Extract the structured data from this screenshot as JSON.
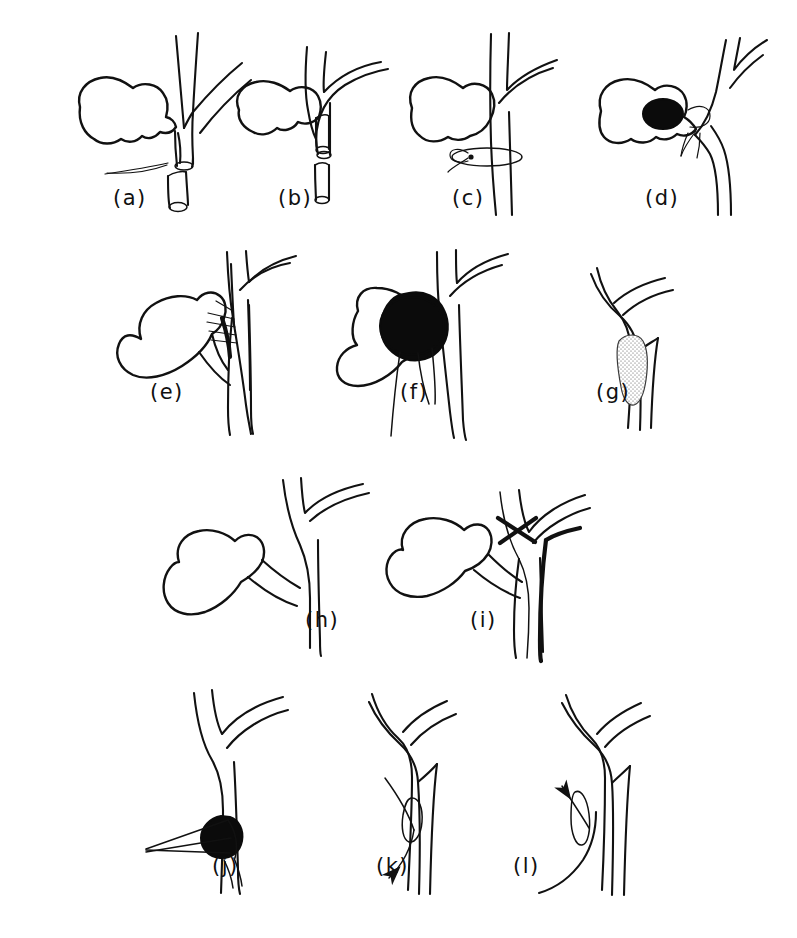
{
  "figure": {
    "kind": "line-drawing-figure",
    "background_color": "#ffffff",
    "ink_color": "#111111",
    "fill_color": "#0b0b0b",
    "stipple_color": "#5a5a5a",
    "width": 797,
    "height": 938,
    "rows": [
      {
        "row_index": 1,
        "panel_labels": [
          "(a)",
          "(b)",
          "(c)",
          "(d)"
        ]
      },
      {
        "row_index": 2,
        "panel_labels": [
          "(e)",
          "(f)",
          "(g)"
        ]
      },
      {
        "row_index": 3,
        "panel_labels": [
          "(h)",
          "(i)"
        ]
      },
      {
        "row_index": 4,
        "panel_labels": [
          "(j)",
          "(k)",
          "(l)"
        ]
      }
    ]
  },
  "panels": [
    {
      "id": "a",
      "label": "(a)",
      "label_x": 113,
      "label_y": 205,
      "features": [
        "gallbladder",
        "bile-duct-tree",
        "transected-duct-stump",
        "detached-duct-segment",
        "fine-suture-thread"
      ]
    },
    {
      "id": "b",
      "label": "(b)",
      "label_x": 278,
      "label_y": 205,
      "features": [
        "gallbladder",
        "curved-bile-duct",
        "cut-duct-end",
        "duct-stump-segment",
        "free-duct-segment"
      ]
    },
    {
      "id": "c",
      "label": "(c)",
      "label_x": 452,
      "label_y": 205,
      "features": [
        "gallbladder",
        "bile-duct-tree",
        "encircling-ligature-loop",
        "suture-knot"
      ]
    },
    {
      "id": "d",
      "label": "(d)",
      "label_x": 645,
      "label_y": 205,
      "features": [
        "gallbladder",
        "black-stone",
        "bile-duct-tree",
        "suture-loop",
        "suture-tails"
      ]
    },
    {
      "id": "e",
      "label": "(e)",
      "label_x": 150,
      "label_y": 399,
      "features": [
        "gallbladder",
        "bile-duct-tree",
        "suture-row",
        "anastomosis"
      ]
    },
    {
      "id": "f",
      "label": "(f)",
      "label_x": 400,
      "label_y": 399,
      "features": [
        "gallbladder",
        "large-black-mass",
        "bile-duct-tree",
        "trailing-threads"
      ]
    },
    {
      "id": "g",
      "label": "(g)",
      "label_x": 596,
      "label_y": 399,
      "features": [
        "bile-duct-tree",
        "stippled-intraluminal-lesion"
      ]
    },
    {
      "id": "h",
      "label": "(h)",
      "label_x": 305,
      "label_y": 627,
      "features": [
        "gallbladder",
        "cystic-duct",
        "bile-duct-tree"
      ]
    },
    {
      "id": "i",
      "label": "(i)",
      "label_x": 470,
      "label_y": 627,
      "features": [
        "gallbladder",
        "bile-duct-tree",
        "inserted-catheter",
        "cross-marker"
      ]
    },
    {
      "id": "j",
      "label": "(j)",
      "label_x": 212,
      "label_y": 873,
      "features": [
        "bile-duct-tree",
        "black-stone",
        "wire-basket",
        "forceps-jaws"
      ]
    },
    {
      "id": "k",
      "label": "(k)",
      "label_x": 376,
      "label_y": 873,
      "features": [
        "bile-duct-tree",
        "snare-loop",
        "extraction-arrow-down-left"
      ]
    },
    {
      "id": "l",
      "label": "(l)",
      "label_x": 513,
      "label_y": 873,
      "features": [
        "bile-duct-tree",
        "catheter-loop",
        "insertion-arrow-up-left"
      ]
    }
  ]
}
